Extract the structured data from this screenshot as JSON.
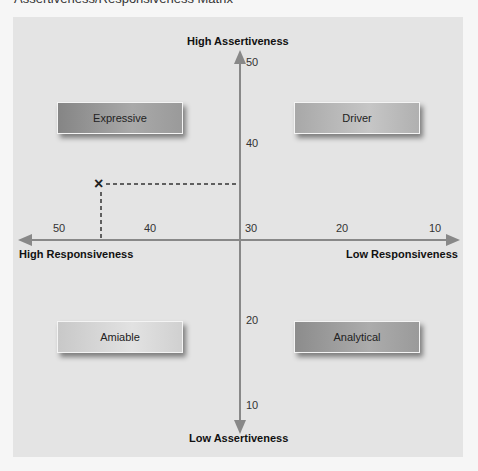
{
  "title": "Assertiveness/Responsiveness Matrix",
  "axes": {
    "top_label": "High Assertiveness",
    "bottom_label": "Low Assertiveness",
    "left_label": "High Responsiveness",
    "right_label": "Low Responsiveness",
    "vertical_ticks": [
      "50",
      "40",
      "30",
      "20",
      "10"
    ],
    "horizontal_ticks": [
      "50",
      "40",
      "30",
      "20",
      "10"
    ]
  },
  "quadrants": {
    "top_left": "Expressive",
    "top_right": "Driver",
    "bottom_left": "Amiable",
    "bottom_right": "Analytical"
  },
  "plotted_point": {
    "symbol": "×",
    "responsiveness": 45,
    "assertiveness": 35
  },
  "colors": {
    "axis": "#888888",
    "panel": "#e4e4e4",
    "dashed_line": "#333333"
  }
}
